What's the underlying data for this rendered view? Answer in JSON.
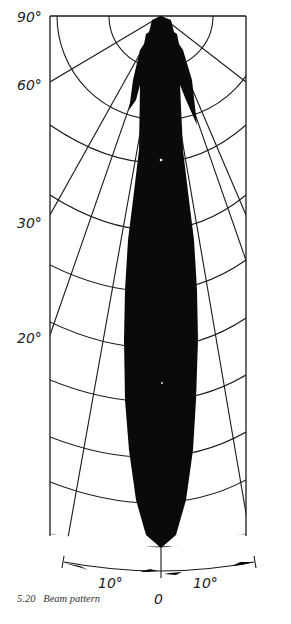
{
  "figure": {
    "caption_number": "5.20",
    "caption_text": "Beam pattern"
  },
  "vertical_axis": {
    "labels": [
      "90°",
      "60°",
      "30°",
      "20°"
    ]
  },
  "horizontal_axis": {
    "labels": [
      "10°",
      "0",
      "10°"
    ]
  },
  "colors": {
    "ink": "#0a0a0a",
    "background": "#ffffff"
  }
}
